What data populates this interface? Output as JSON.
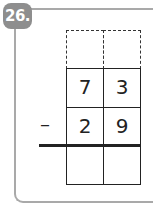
{
  "problem": {
    "number": "26.",
    "operator": "–",
    "carry_row": [
      "",
      ""
    ],
    "minuend": [
      "7",
      "3"
    ],
    "subtrahend": [
      "2",
      "9"
    ],
    "answer": [
      "",
      ""
    ]
  },
  "colors": {
    "badge": "#8e8e8e",
    "frame": "#a9a9a9",
    "ink": "#222222"
  }
}
